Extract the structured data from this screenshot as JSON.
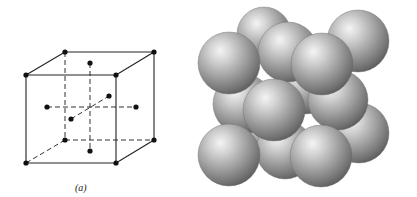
{
  "figure": {
    "caption_a": "(a)",
    "lattice_type": "face-centered cubic",
    "colors": {
      "line": "#222222",
      "atom": "#111111",
      "sphere_highlight": "#f2f2f2",
      "sphere_mid": "#a0a0a0",
      "sphere_edge": "#5e5e5e"
    }
  },
  "unit_cell": {
    "corners": [
      {
        "name": "back-top-left",
        "x": 65,
        "y": 52
      },
      {
        "name": "back-top-right",
        "x": 154,
        "y": 52
      },
      {
        "name": "front-top-left",
        "x": 26,
        "y": 75
      },
      {
        "name": "front-top-right",
        "x": 116,
        "y": 75
      },
      {
        "name": "back-bottom-left",
        "x": 65,
        "y": 140
      },
      {
        "name": "back-bottom-right",
        "x": 154,
        "y": 140
      },
      {
        "name": "front-bottom-left",
        "x": 26,
        "y": 163
      },
      {
        "name": "front-bottom-right",
        "x": 116,
        "y": 163
      }
    ],
    "face_centers": [
      {
        "name": "top",
        "x": 90,
        "y": 63
      },
      {
        "name": "bottom",
        "x": 90,
        "y": 151
      },
      {
        "name": "left",
        "x": 47,
        "y": 107
      },
      {
        "name": "right",
        "x": 136,
        "y": 107
      },
      {
        "name": "front",
        "x": 71,
        "y": 119
      },
      {
        "name": "back",
        "x": 109,
        "y": 96
      }
    ]
  },
  "hard_sphere_model": {
    "spheres": [
      {
        "name": "back-bottom-left",
        "cx": 262,
        "cy": 128,
        "r": 29
      },
      {
        "name": "left-face",
        "cx": 243,
        "cy": 104,
        "r": 30
      },
      {
        "name": "bottom-face",
        "cx": 285,
        "cy": 150,
        "r": 29
      },
      {
        "name": "back-top-left",
        "cx": 264,
        "cy": 34,
        "r": 27
      },
      {
        "name": "back-face",
        "cx": 305,
        "cy": 85,
        "r": 29
      },
      {
        "name": "back-top-right",
        "cx": 358,
        "cy": 41,
        "r": 31
      },
      {
        "name": "back-bottom-right",
        "cx": 359,
        "cy": 133,
        "r": 30
      },
      {
        "name": "right-face",
        "cx": 338,
        "cy": 100,
        "r": 30
      },
      {
        "name": "top-face",
        "cx": 288,
        "cy": 52,
        "r": 30
      },
      {
        "name": "front-top-left",
        "cx": 229,
        "cy": 63,
        "r": 31
      },
      {
        "name": "front-top-right",
        "cx": 322,
        "cy": 64,
        "r": 31
      },
      {
        "name": "front-face",
        "cx": 274,
        "cy": 110,
        "r": 31
      },
      {
        "name": "front-bottom-left",
        "cx": 229,
        "cy": 155,
        "r": 31
      },
      {
        "name": "front-bottom-right",
        "cx": 321,
        "cy": 156,
        "r": 31
      }
    ]
  }
}
